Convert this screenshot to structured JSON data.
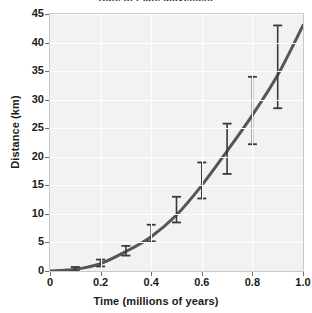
{
  "chart_data": {
    "type": "line",
    "title": "Rate of Plate Movement",
    "xlabel": "Time (millions of years)",
    "ylabel": "Distance (km)",
    "xlim": [
      0,
      1.0
    ],
    "ylim": [
      0,
      45
    ],
    "grid": true,
    "legend": "none",
    "xticks": [
      "0",
      "0.2",
      "0.4",
      "0.6",
      "0.8",
      "1.0"
    ],
    "xtick_values": [
      0,
      0.2,
      0.4,
      0.6,
      0.8,
      1.0
    ],
    "yticks": [
      "0",
      "5",
      "10",
      "15",
      "20",
      "25",
      "30",
      "35",
      "40",
      "45"
    ],
    "ytick_values": [
      0,
      5,
      10,
      15,
      20,
      25,
      30,
      35,
      40,
      45
    ],
    "series": [
      {
        "name": "Distance travelled",
        "style": "smooth-curve",
        "color": "#555555",
        "x": [
          0,
          0.1,
          0.2,
          0.3,
          0.4,
          0.5,
          0.6,
          0.7,
          0.8,
          0.9,
          1.0
        ],
        "values": [
          0,
          0.3,
          1.3,
          3.4,
          6.0,
          9.8,
          15.0,
          21.0,
          27.3,
          34.3,
          43.0
        ]
      }
    ],
    "error_bars": {
      "color": "#3a3a3a",
      "points": [
        {
          "x": 0.1,
          "y": 0.3,
          "low": 0.0,
          "high": 0.7
        },
        {
          "x": 0.2,
          "y": 1.3,
          "low": 0.8,
          "high": 2.0
        },
        {
          "x": 0.3,
          "y": 3.4,
          "low": 2.7,
          "high": 4.4
        },
        {
          "x": 0.4,
          "y": 6.0,
          "low": 5.2,
          "high": 8.1
        },
        {
          "x": 0.5,
          "y": 9.8,
          "low": 8.5,
          "high": 13.0
        },
        {
          "x": 0.6,
          "y": 15.0,
          "low": 12.7,
          "high": 19.0
        },
        {
          "x": 0.7,
          "y": 21.0,
          "low": 17.0,
          "high": 25.8
        },
        {
          "x": 0.8,
          "y": 27.3,
          "low": 22.2,
          "high": 34.0
        },
        {
          "x": 0.9,
          "y": 34.3,
          "low": 28.5,
          "high": 43.0
        }
      ]
    }
  }
}
